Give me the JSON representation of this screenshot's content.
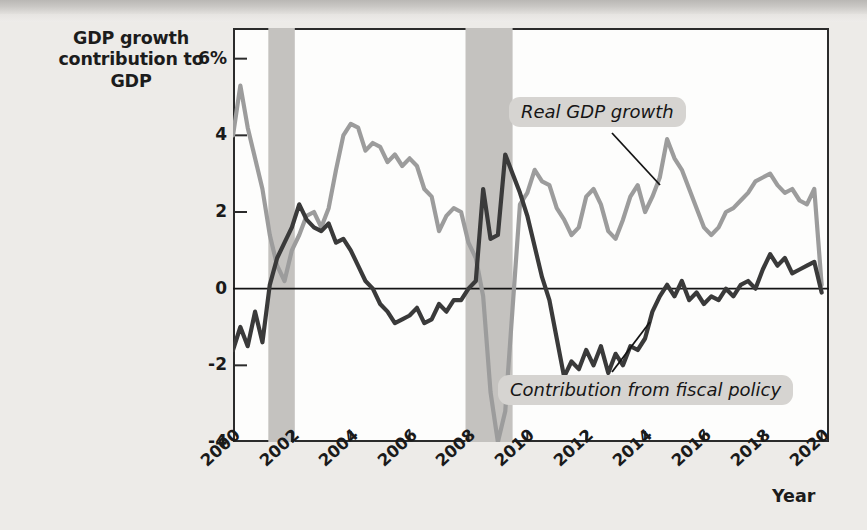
{
  "chart_data": {
    "type": "line",
    "title": "",
    "ylabel": "GDP growth contribution to GDP",
    "xlabel": "Year",
    "ylim": [
      -4,
      6.8
    ],
    "xlim": [
      2000,
      2020.25
    ],
    "yticks": [
      "6%",
      "4",
      "2",
      "0",
      "-2",
      "-4"
    ],
    "ytick_values": [
      6,
      4,
      2,
      0,
      -2,
      -4
    ],
    "xticks": [
      "2000",
      "2002",
      "2004",
      "2006",
      "2008",
      "2010",
      "2012",
      "2014",
      "2016",
      "2018",
      "2020"
    ],
    "xtick_values": [
      2000,
      2002,
      2004,
      2006,
      2008,
      2010,
      2012,
      2014,
      2016,
      2018,
      2020
    ],
    "grid": false,
    "zero_line": true,
    "legend_position": "annotations",
    "shaded_regions": [
      {
        "name": "recession-2001",
        "start": 2001.2,
        "end": 2002.1
      },
      {
        "name": "recession-2008",
        "start": 2007.9,
        "end": 2009.5
      }
    ],
    "x": [
      2000.0,
      2000.25,
      2000.5,
      2000.75,
      2001.0,
      2001.25,
      2001.5,
      2001.75,
      2002.0,
      2002.25,
      2002.5,
      2002.75,
      2003.0,
      2003.25,
      2003.5,
      2003.75,
      2004.0,
      2004.25,
      2004.5,
      2004.75,
      2005.0,
      2005.25,
      2005.5,
      2005.75,
      2006.0,
      2006.25,
      2006.5,
      2006.75,
      2007.0,
      2007.25,
      2007.5,
      2007.75,
      2008.0,
      2008.25,
      2008.5,
      2008.75,
      2009.0,
      2009.25,
      2009.5,
      2009.75,
      2010.0,
      2010.25,
      2010.5,
      2010.75,
      2011.0,
      2011.25,
      2011.5,
      2011.75,
      2012.0,
      2012.25,
      2012.5,
      2012.75,
      2013.0,
      2013.25,
      2013.5,
      2013.75,
      2014.0,
      2014.25,
      2014.5,
      2014.75,
      2015.0,
      2015.25,
      2015.5,
      2015.75,
      2016.0,
      2016.25,
      2016.5,
      2016.75,
      2017.0,
      2017.25,
      2017.5,
      2017.75,
      2018.0,
      2018.25,
      2018.5,
      2018.75,
      2019.0,
      2019.25,
      2019.5,
      2019.75,
      2020.0
    ],
    "series": [
      {
        "name": "Real GDP growth",
        "color": "#9c9c9c",
        "values": [
          4.0,
          5.3,
          4.2,
          3.4,
          2.6,
          1.4,
          0.6,
          0.2,
          1.0,
          1.4,
          1.9,
          2.0,
          1.6,
          2.1,
          3.1,
          4.0,
          4.3,
          4.2,
          3.6,
          3.8,
          3.7,
          3.3,
          3.5,
          3.2,
          3.4,
          3.2,
          2.6,
          2.4,
          1.5,
          1.9,
          2.1,
          2.0,
          1.2,
          0.8,
          -0.2,
          -2.7,
          -4.0,
          -3.2,
          -0.5,
          2.2,
          2.5,
          3.1,
          2.8,
          2.7,
          2.1,
          1.8,
          1.4,
          1.6,
          2.4,
          2.6,
          2.2,
          1.5,
          1.3,
          1.8,
          2.4,
          2.7,
          2.0,
          2.4,
          2.9,
          3.9,
          3.4,
          3.1,
          2.6,
          2.1,
          1.6,
          1.4,
          1.6,
          2.0,
          2.1,
          2.3,
          2.5,
          2.8,
          2.9,
          3.0,
          2.7,
          2.5,
          2.6,
          2.3,
          2.2,
          2.6,
          0.1
        ]
      },
      {
        "name": "Contribution from fiscal policy",
        "color": "#3a3a3a",
        "values": [
          -1.6,
          -1.0,
          -1.5,
          -0.6,
          -1.4,
          0.1,
          0.8,
          1.2,
          1.6,
          2.2,
          1.8,
          1.6,
          1.5,
          1.7,
          1.2,
          1.3,
          1.0,
          0.6,
          0.2,
          0.0,
          -0.4,
          -0.6,
          -0.9,
          -0.8,
          -0.7,
          -0.5,
          -0.9,
          -0.8,
          -0.4,
          -0.6,
          -0.3,
          -0.3,
          0.0,
          0.2,
          2.6,
          1.3,
          1.4,
          3.5,
          3.0,
          2.5,
          1.9,
          1.1,
          0.3,
          -0.3,
          -1.3,
          -2.3,
          -1.9,
          -2.1,
          -1.6,
          -2.0,
          -1.5,
          -2.2,
          -1.7,
          -2.0,
          -1.5,
          -1.6,
          -1.3,
          -0.6,
          -0.2,
          0.1,
          -0.2,
          0.2,
          -0.3,
          -0.1,
          -0.4,
          -0.2,
          -0.3,
          0.0,
          -0.2,
          0.1,
          0.2,
          0.0,
          0.5,
          0.9,
          0.6,
          0.8,
          0.4,
          0.5,
          0.6,
          0.7,
          -0.1
        ]
      }
    ],
    "annotations": [
      {
        "name": "real-gdp-growth-callout",
        "text": "Real GDP growth"
      },
      {
        "name": "fiscal-policy-callout",
        "text": "Contribution from fiscal policy"
      }
    ]
  },
  "axis": {
    "y_title_line1": "GDP growth",
    "y_title_line2": "contribution to GDP",
    "x_title": "Year"
  },
  "colors": {
    "gdp_line": "#9c9c9c",
    "fiscal_line": "#3a3a3a",
    "recession_band": "#c4c2bf",
    "callout_bg": "#d6d4d1",
    "axis": "#2b2b2b",
    "paper": "#edebe8"
  }
}
